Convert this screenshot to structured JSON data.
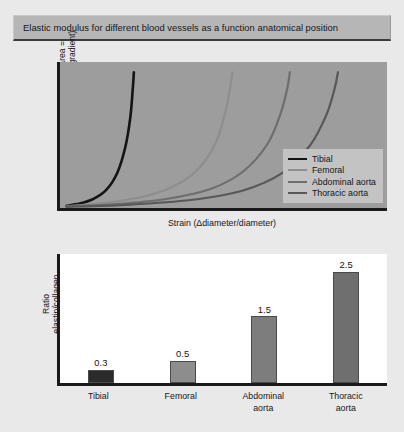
{
  "figure": {
    "title": "Elastic modulus for different blood vessels as a function anatomical position",
    "background_color": "#e9e9e9",
    "title_band_color": "#b6b6b6"
  },
  "chart_data": [
    {
      "type": "line",
      "title": "Elastic modulus for different blood vessels as a function anatomical position",
      "xlabel": "Strain (Δdiameter/diameter)",
      "ylabel": "Stress (force/unit area = transmural pressure gradient)",
      "ylabel_line1": "Stress (force/unit area =",
      "ylabel_line2": "transmural pressure gradient)",
      "grid": false,
      "axis_ticks": false,
      "xlim": [
        0,
        1
      ],
      "ylim": [
        0,
        1
      ],
      "plot_background": "#9d9d9d",
      "axis_color": "#1a1a1a",
      "legend_position": "bottom-right",
      "legend_background": "#c3c3c3",
      "series": [
        {
          "name": "Tibial",
          "color": "#141414",
          "linewidth": 2.6,
          "note": "steepest curve, reaches high stress at low strain",
          "points": [
            [
              0.02,
              0.015
            ],
            [
              0.06,
              0.03
            ],
            [
              0.1,
              0.06
            ],
            [
              0.14,
              0.12
            ],
            [
              0.175,
              0.24
            ],
            [
              0.2,
              0.42
            ],
            [
              0.215,
              0.62
            ],
            [
              0.222,
              0.8
            ],
            [
              0.226,
              0.93
            ]
          ]
        },
        {
          "name": "Femoral",
          "color": "#8e8e8e",
          "linewidth": 2.2,
          "note": "second curve, shifted right of tibial",
          "points": [
            [
              0.02,
              0.012
            ],
            [
              0.12,
              0.03
            ],
            [
              0.24,
              0.07
            ],
            [
              0.34,
              0.14
            ],
            [
              0.42,
              0.26
            ],
            [
              0.475,
              0.44
            ],
            [
              0.505,
              0.65
            ],
            [
              0.52,
              0.82
            ],
            [
              0.527,
              0.93
            ]
          ]
        },
        {
          "name": "Abdominal aorta",
          "color": "#6e6e6e",
          "linewidth": 2.2,
          "note": "third curve, shifted further right",
          "points": [
            [
              0.02,
              0.01
            ],
            [
              0.16,
              0.025
            ],
            [
              0.32,
              0.06
            ],
            [
              0.46,
              0.13
            ],
            [
              0.56,
              0.25
            ],
            [
              0.635,
              0.44
            ],
            [
              0.675,
              0.65
            ],
            [
              0.695,
              0.82
            ],
            [
              0.703,
              0.93
            ]
          ]
        },
        {
          "name": "Thoracic aorta",
          "color": "#585858",
          "linewidth": 2.2,
          "note": "rightmost curve, most compliant",
          "points": [
            [
              0.02,
              0.008
            ],
            [
              0.2,
              0.022
            ],
            [
              0.4,
              0.055
            ],
            [
              0.56,
              0.12
            ],
            [
              0.68,
              0.24
            ],
            [
              0.765,
              0.43
            ],
            [
              0.815,
              0.64
            ],
            [
              0.84,
              0.82
            ],
            [
              0.85,
              0.93
            ]
          ]
        }
      ]
    },
    {
      "type": "bar",
      "xlabel": "",
      "ylabel": "Ratio elastin/collagen",
      "ylabel_line1": "Ratio",
      "ylabel_line2": "elastin/collagen",
      "grid": false,
      "axis_ticks": false,
      "ylim": [
        0,
        2.9
      ],
      "plot_background": "#ffffff",
      "axis_color": "#1a1a1a",
      "categories": [
        "Tibial",
        "Femoral",
        "Abdominal aorta",
        "Thoracic aorta"
      ],
      "category_lines": [
        [
          "Tibial"
        ],
        [
          "Femoral"
        ],
        [
          "Abdominal",
          "aorta"
        ],
        [
          "Thoracic",
          "aorta"
        ]
      ],
      "values": [
        0.3,
        0.5,
        1.5,
        2.5
      ],
      "value_labels": [
        "0.3",
        "0.5",
        "1.5",
        "2.5"
      ],
      "bar_colors": [
        "#2b2b2b",
        "#8d8d8d",
        "#7d7d7d",
        "#6f6f6f"
      ]
    }
  ]
}
